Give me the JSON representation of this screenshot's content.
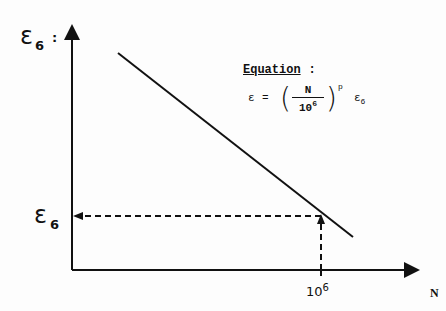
{
  "diagram": {
    "type": "fatigue-strain-vs-cycles",
    "y_axis": {
      "label": "ε",
      "label_sub": "6",
      "suffix": ":"
    },
    "x_axis": {
      "label": "N"
    },
    "y_marker": {
      "label": "ε",
      "label_sub": "6"
    },
    "x_marker": {
      "base": "10",
      "exp": "6"
    },
    "equation": {
      "title": "Equation",
      "title_suffix": ":",
      "lhs": "ε",
      "eq_sign": "=",
      "numerator": "N",
      "denominator_base": "10",
      "denominator_exp": "6",
      "exponent": "p",
      "tail": "ε",
      "tail_sub": "6"
    },
    "colors": {
      "ink": "#111111",
      "background": "#fdfdfd"
    }
  }
}
